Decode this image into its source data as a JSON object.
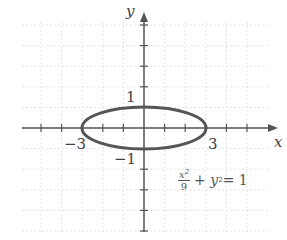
{
  "chart_data": {
    "type": "line",
    "title": "",
    "xlabel": "x",
    "ylabel": "y",
    "xlim": [
      -5,
      5
    ],
    "ylim": [
      -5,
      5
    ],
    "grid": true,
    "tick_labels": {
      "x": [
        "-3",
        "3"
      ],
      "y": [
        "1",
        "-1"
      ]
    },
    "series": [
      {
        "name": "ellipse",
        "equation": "x^2/9 + y^2 = 1",
        "a": 3,
        "b": 1,
        "center": [
          0,
          0
        ]
      }
    ],
    "annotations": [
      {
        "text": "x²/9 + y² = 1",
        "position": [
          2.2,
          -3
        ]
      }
    ]
  },
  "labels": {
    "x_axis": "x",
    "y_axis": "y",
    "tick_neg3": "−3",
    "tick_3": "3",
    "tick_1": "1",
    "tick_neg1": "−1",
    "eq_num": "x",
    "eq_num_exp": "2",
    "eq_den": "9",
    "eq_rest": "+ y",
    "eq_rest_exp": "2",
    "eq_tail": " = 1"
  },
  "colors": {
    "grid": "#e6e6e6",
    "axis": "#555555",
    "curve": "#555555"
  }
}
